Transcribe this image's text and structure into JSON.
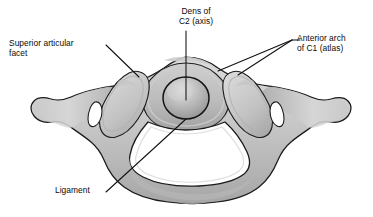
{
  "figure": {
    "background_color": "#ffffff",
    "outline_color": "#1a1a1a",
    "bone_fill_light": "#d6d6d6",
    "bone_fill_mid": "#b9b9b9",
    "bone_fill_dark": "#9a9a9a",
    "dens_fill_light": "#dcdcdc",
    "dens_fill_dark": "#8e8e8e",
    "foramen_fill": "#ffffff",
    "leader_line_color": "#111111",
    "leader_line_width": 1.05
  },
  "labels": {
    "superior_articular_facet": {
      "line1": "Superior articular",
      "line2": "facet"
    },
    "dens_of_c2": {
      "line1": "Dens of",
      "line2": "C2 (axis)"
    },
    "anterior_arch_c1": {
      "line1": "Anterior arch",
      "line2": "of C1 (atlas)"
    },
    "ligament": {
      "line1": "Ligament"
    }
  }
}
